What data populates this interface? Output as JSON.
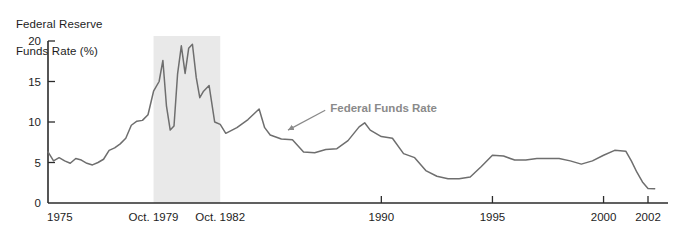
{
  "chart_data": {
    "type": "line",
    "title": "Federal Reserve\nFunds Rate (%)",
    "title_line1": "Federal Reserve",
    "title_line2": "Funds Rate (%)",
    "xlabel": "",
    "ylabel": "Federal Reserve Funds Rate (%)",
    "ylim": [
      0,
      20
    ],
    "xlim": [
      1975,
      2002.4
    ],
    "grid": false,
    "legend": "none",
    "yticks": [
      0,
      5,
      10,
      15,
      20
    ],
    "ytick_labels": [
      "0",
      "5",
      "10",
      "15",
      "20"
    ],
    "xticks": [
      1975,
      1979.75,
      1982.75,
      1990,
      1995,
      2000,
      2002
    ],
    "xtick_labels": [
      "1975",
      "Oct. 1979",
      "Oct. 1982",
      "1990",
      "1995",
      "2000",
      "2002"
    ],
    "line_color": "#6e6e6e",
    "shaded_band": {
      "label": "Oct. 1979 - Oct. 1982",
      "x_start": 1979.75,
      "x_end": 1982.75,
      "color": "#e9e9e9"
    },
    "annotations": [
      {
        "text": "Federal Funds Rate",
        "color": "#8a8a8a",
        "x": 1987.7,
        "y": 11.2,
        "arrow_to_x": 1985.8,
        "arrow_to_y": 9.0
      }
    ],
    "series": [
      {
        "name": "Federal Funds Rate",
        "x": [
          1975.0,
          1975.25,
          1975.5,
          1975.75,
          1976.0,
          1976.25,
          1976.5,
          1976.75,
          1977.0,
          1977.25,
          1977.5,
          1977.75,
          1978.0,
          1978.25,
          1978.5,
          1978.75,
          1979.0,
          1979.25,
          1979.5,
          1979.75,
          1980.0,
          1980.17,
          1980.33,
          1980.5,
          1980.67,
          1980.83,
          1981.0,
          1981.17,
          1981.33,
          1981.5,
          1981.67,
          1981.83,
          1982.0,
          1982.25,
          1982.5,
          1982.75,
          1983.0,
          1983.5,
          1984.0,
          1984.5,
          1984.75,
          1985.0,
          1985.5,
          1986.0,
          1986.5,
          1987.0,
          1987.5,
          1988.0,
          1988.5,
          1989.0,
          1989.25,
          1989.5,
          1990.0,
          1990.5,
          1991.0,
          1991.5,
          1992.0,
          1992.5,
          1993.0,
          1993.5,
          1994.0,
          1994.5,
          1995.0,
          1995.5,
          1996.0,
          1996.5,
          1997.0,
          1997.5,
          1998.0,
          1998.5,
          1999.0,
          1999.5,
          2000.0,
          2000.5,
          2001.0,
          2001.25,
          2001.5,
          2001.75,
          2002.0,
          2002.3
        ],
        "values": [
          6.3,
          5.2,
          5.6,
          5.2,
          4.9,
          5.5,
          5.3,
          4.9,
          4.7,
          5.0,
          5.4,
          6.5,
          6.8,
          7.3,
          8.0,
          9.6,
          10.1,
          10.2,
          10.9,
          13.8,
          15.0,
          17.6,
          12.0,
          9.0,
          9.5,
          15.9,
          19.4,
          16.0,
          19.1,
          19.6,
          15.5,
          13.0,
          13.8,
          14.5,
          10.0,
          9.7,
          8.6,
          9.3,
          10.3,
          11.6,
          9.3,
          8.4,
          7.9,
          7.8,
          6.3,
          6.2,
          6.6,
          6.7,
          7.7,
          9.4,
          9.9,
          9.0,
          8.2,
          8.0,
          6.1,
          5.6,
          4.0,
          3.3,
          3.0,
          3.0,
          3.2,
          4.5,
          5.9,
          5.8,
          5.3,
          5.3,
          5.5,
          5.5,
          5.5,
          5.2,
          4.8,
          5.2,
          5.9,
          6.5,
          6.4,
          5.2,
          3.8,
          2.6,
          1.8,
          1.75
        ]
      }
    ]
  }
}
